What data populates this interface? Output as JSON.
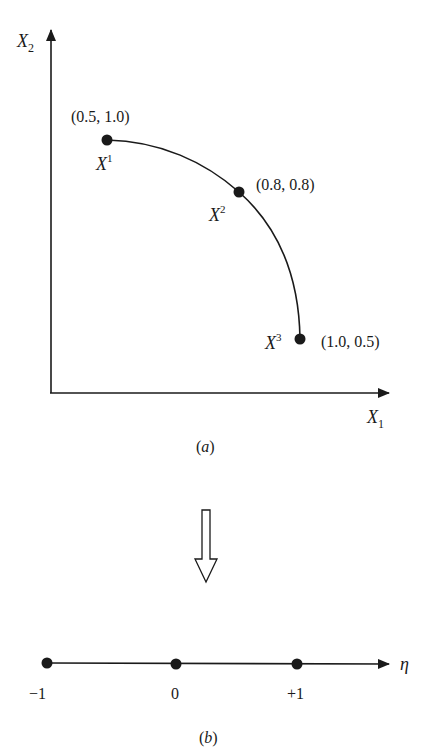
{
  "figure_a": {
    "axes": {
      "x_label": "X",
      "x_label_sub": "1",
      "y_label": "X",
      "y_label_sub": "2"
    },
    "points": [
      {
        "name": "X",
        "sup": "1",
        "coords": "(0.5, 1.0)"
      },
      {
        "name": "X",
        "sup": "2",
        "coords": "(0.8, 0.8)"
      },
      {
        "name": "X",
        "sup": "3",
        "coords": "(1.0, 0.5)"
      }
    ],
    "caption_open": "(",
    "caption_letter": "a",
    "caption_close": ")"
  },
  "transform_arrow": "hollow-down-arrow",
  "figure_b": {
    "axis_label": "η",
    "ticks": [
      {
        "label": "−1"
      },
      {
        "label": "0"
      },
      {
        "label": "+1"
      }
    ],
    "caption_open": "(",
    "caption_letter": "b",
    "caption_close": ")"
  },
  "colors": {
    "ink": "#1a1a1a",
    "background": "#ffffff"
  }
}
